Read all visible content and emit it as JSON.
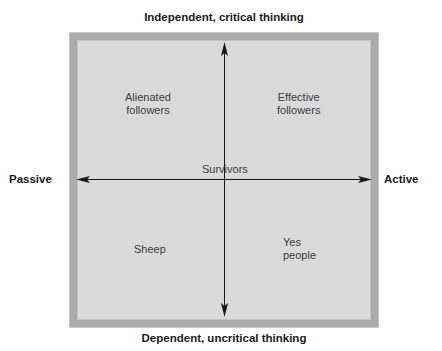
{
  "diagram": {
    "axes": {
      "top": "Independent, critical thinking",
      "bottom": "Dependent, uncritical thinking",
      "left": "Passive",
      "right": "Active"
    },
    "quadrants": {
      "top_left": {
        "line1": "Alienated",
        "line2": "followers"
      },
      "top_right": {
        "line1": "Effective",
        "line2": "followers"
      },
      "bottom_left": {
        "line1": "Sheep"
      },
      "bottom_right": {
        "line1": "Yes",
        "line2": "people"
      },
      "center": {
        "line1": "Survivors"
      }
    },
    "colors": {
      "box_fill": "#dadada",
      "box_border": "#ababab",
      "axis_line": "#1a1a1a",
      "text": "#3a3a3a"
    }
  }
}
